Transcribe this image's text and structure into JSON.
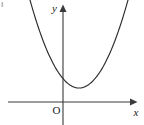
{
  "figure": {
    "background_color": "#ffffff",
    "width": 144,
    "height": 125,
    "axis_color": "#3a3a3a",
    "curve_color": "#2b2b2b",
    "label_color": "#1c1c1c"
  },
  "labels": {
    "x_axis": "x",
    "y_axis": "y",
    "origin": "O"
  },
  "chart_data": {
    "type": "line",
    "title": "",
    "subtitle": "",
    "xlabel": "x",
    "ylabel": "y",
    "legend": [],
    "legend_position": "none",
    "grid": false,
    "annotations": [
      {
        "text": "O",
        "role": "origin-label",
        "x": 0,
        "y": 0
      },
      {
        "text": "y",
        "role": "y-axis-label",
        "x": 0,
        "y": 4.9
      },
      {
        "text": "x",
        "role": "x-axis-label",
        "x": 4.3,
        "y": 0
      }
    ],
    "axes": {
      "x_axis_pixel_y": 102,
      "y_axis_pixel_x": 63,
      "x_axis_pixel_span": [
        8,
        133
      ],
      "y_axis_pixel_span": [
        10,
        125
      ],
      "x_arrow": "right",
      "y_arrow": "up",
      "ticks_x": [],
      "ticks_y": [],
      "xlim": [
        -2.0,
        2.8
      ],
      "ylim": [
        -0.5,
        3.6
      ]
    },
    "series": [
      {
        "name": "parabola",
        "equation": "y = a(x - h)^2 + k",
        "vertex": {
          "x": 0.55,
          "y": 0.47
        },
        "opens": "up",
        "y_intercept": 0.95,
        "x_intercepts": [],
        "discriminant_sign": "negative",
        "x": [
          -1.45,
          -1.2,
          -0.95,
          -0.7,
          -0.45,
          -0.2,
          0.05,
          0.3,
          0.55,
          0.8,
          1.05,
          1.3,
          1.55,
          1.8,
          2.05,
          2.3
        ],
        "y": [
          3.6,
          2.97,
          2.41,
          1.91,
          1.47,
          1.1,
          0.78,
          0.53,
          0.47,
          0.53,
          0.78,
          1.1,
          1.47,
          1.91,
          2.41,
          2.97
        ],
        "pixel_points": [
          {
            "x": 30,
            "y": 0
          },
          {
            "x": 36,
            "y": 13
          },
          {
            "x": 42,
            "y": 25
          },
          {
            "x": 48,
            "y": 36
          },
          {
            "x": 54,
            "y": 46
          },
          {
            "x": 60,
            "y": 54
          },
          {
            "x": 63,
            "y": 72
          },
          {
            "x": 70,
            "y": 81
          },
          {
            "x": 79,
            "y": 88
          },
          {
            "x": 88,
            "y": 81
          },
          {
            "x": 96,
            "y": 70
          },
          {
            "x": 104,
            "y": 57
          },
          {
            "x": 112,
            "y": 41
          },
          {
            "x": 120,
            "y": 22
          },
          {
            "x": 128,
            "y": 0
          }
        ]
      }
    ]
  }
}
